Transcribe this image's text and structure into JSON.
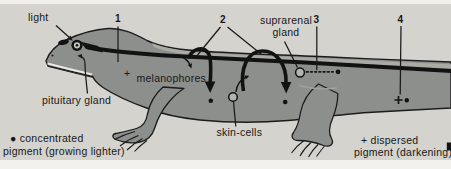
{
  "figure": {
    "markers": {
      "n1": "1",
      "n2": "2",
      "n3": "3",
      "n4": "4"
    },
    "labels": {
      "light": "light",
      "pituitary_gland": "pituitary gland",
      "melanophores_plus": "+",
      "melanophores": "melanophores",
      "suprarenal_line1": "suprarenal",
      "suprarenal_line2": "gland",
      "skin_cells": "skin-cells"
    },
    "legend": {
      "concentrated_line1": "● concentrated",
      "concentrated_line2": "pigment (growing lighter)",
      "dispersed_line1": "+ dispersed",
      "dispersed_line2": "pigment (darkening)"
    },
    "colors": {
      "page_bg": "#f1f0ec",
      "photo_bg": "#d4d3ce",
      "body_gray": "#8d8f8d",
      "dorsal_highlight": "#ababa5",
      "ink": "#141414"
    }
  }
}
